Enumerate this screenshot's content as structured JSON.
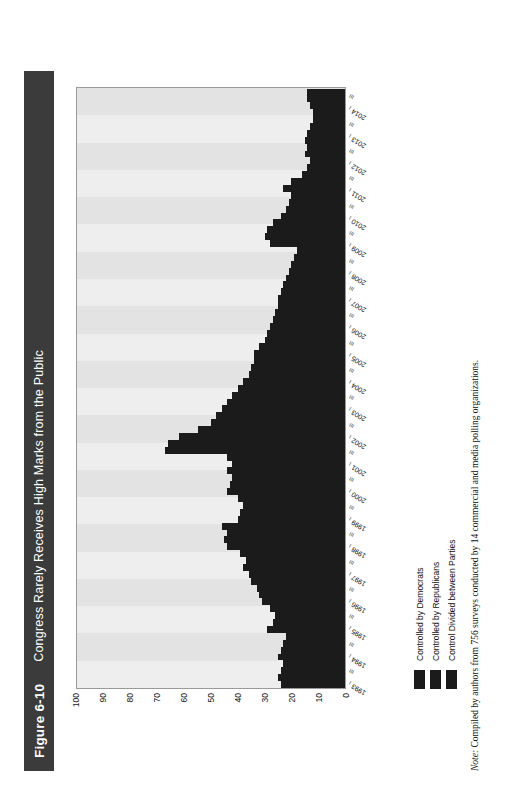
{
  "figure": {
    "number": "Figure 6-10",
    "title": "Congress Rarely Receives High Marks from the Public"
  },
  "note": {
    "label": "Note:",
    "text": " Compiled by authors from 756 surveys conducted by 14 commercial and media polling organizations."
  },
  "legend": {
    "position": "below-plot",
    "items": [
      {
        "label": "Controlled by Democrats",
        "color": "#1b1b1b"
      },
      {
        "label": "Controlled by Republicans",
        "color": "#1b1b1b"
      },
      {
        "label": "Control Divided between Parties",
        "color": "#1b1b1b"
      }
    ]
  },
  "colors": {
    "title_bar_bg": "#3b3b3b",
    "title_bar_text": "#ffffff",
    "bar": "#1b1b1b",
    "plot_bg": "#f1f1f1",
    "band_light": "#eeeeee",
    "band_dark": "#e3e3e3",
    "frame": "#9a9a9a"
  },
  "chart_data": {
    "type": "bar",
    "orientation": "vertical",
    "title": "Congress Rarely Receives High Marks from the Public",
    "xlabel": "",
    "ylabel": "Percent Approving (Quarterly Average)",
    "ylim": [
      0,
      100
    ],
    "yticks": [
      100,
      90,
      80,
      70,
      60,
      50,
      40,
      30,
      20,
      10,
      0
    ],
    "grid": "vertical-bands",
    "legend_position": "below",
    "quarter_marks": [
      "I",
      "III"
    ],
    "years": [
      1993,
      1994,
      1995,
      1996,
      1997,
      1998,
      1999,
      2000,
      2001,
      2002,
      2003,
      2004,
      2005,
      2006,
      2007,
      2008,
      2009,
      2010,
      2011,
      2012,
      2013,
      2014
    ],
    "categories": [
      "1993 I",
      "1993 II",
      "1993 III",
      "1993 IV",
      "1994 I",
      "1994 II",
      "1994 III",
      "1994 IV",
      "1995 I",
      "1995 II",
      "1995 III",
      "1995 IV",
      "1996 I",
      "1996 II",
      "1996 III",
      "1996 IV",
      "1997 I",
      "1997 II",
      "1997 III",
      "1997 IV",
      "1998 I",
      "1998 II",
      "1998 III",
      "1998 IV",
      "1999 I",
      "1999 II",
      "1999 III",
      "1999 IV",
      "2000 I",
      "2000 II",
      "2000 III",
      "2000 IV",
      "2001 I",
      "2001 II",
      "2001 III",
      "2001 IV",
      "2002 I",
      "2002 II",
      "2002 III",
      "2002 IV",
      "2003 I",
      "2003 II",
      "2003 III",
      "2003 IV",
      "2004 I",
      "2004 II",
      "2004 III",
      "2004 IV",
      "2005 I",
      "2005 II",
      "2005 III",
      "2005 IV",
      "2006 I",
      "2006 II",
      "2006 III",
      "2006 IV",
      "2007 I",
      "2007 II",
      "2007 III",
      "2007 IV",
      "2008 I",
      "2008 II",
      "2008 III",
      "2008 IV",
      "2009 I",
      "2009 II",
      "2009 III",
      "2009 IV",
      "2010 I",
      "2010 II",
      "2010 III",
      "2010 IV",
      "2011 I",
      "2011 II",
      "2011 III",
      "2011 IV",
      "2012 I",
      "2012 II",
      "2012 III",
      "2012 IV",
      "2013 I",
      "2013 II",
      "2013 III",
      "2013 IV",
      "2014 I",
      "2014 II",
      "2014 III"
    ],
    "values": [
      24,
      25,
      24,
      23,
      25,
      24,
      23,
      22,
      29,
      27,
      26,
      28,
      31,
      32,
      33,
      35,
      36,
      38,
      37,
      39,
      44,
      45,
      44,
      46,
      40,
      39,
      38,
      40,
      44,
      43,
      42,
      44,
      42,
      44,
      67,
      66,
      62,
      55,
      50,
      48,
      46,
      44,
      42,
      40,
      38,
      36,
      35,
      34,
      34,
      32,
      30,
      29,
      28,
      27,
      26,
      25,
      25,
      24,
      23,
      22,
      21,
      20,
      19,
      18,
      28,
      30,
      29,
      27,
      24,
      22,
      21,
      20,
      23,
      20,
      16,
      14,
      13,
      15,
      14,
      15,
      14,
      13,
      12,
      12,
      13,
      14,
      14
    ]
  }
}
